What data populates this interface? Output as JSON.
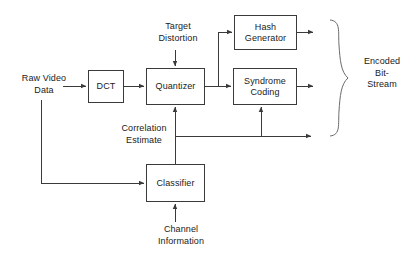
{
  "diagram": {
    "stroke_color": "#3a3a3a",
    "text_color": "#1a1a1a",
    "background": "#ffffff",
    "nodes": [
      {
        "id": "dct",
        "label": "DCT"
      },
      {
        "id": "quantizer",
        "label": "Quantizer"
      },
      {
        "id": "hash",
        "label": "Hash\nGenerator"
      },
      {
        "id": "syndrome",
        "label": "Syndrome\nCoding"
      },
      {
        "id": "classifier",
        "label": "Classifier"
      }
    ],
    "labels": [
      {
        "id": "raw-video",
        "text": "Raw Video\nData"
      },
      {
        "id": "target",
        "text": "Target\nDistortion"
      },
      {
        "id": "correlation",
        "text": "Correlation\nEstimate"
      },
      {
        "id": "channel",
        "text": "Channel\nInformation"
      },
      {
        "id": "encoded",
        "text": "Encoded\nBit-\nStream"
      }
    ],
    "connections": [
      {
        "from": "raw-video",
        "to": "dct"
      },
      {
        "from": "dct",
        "to": "quantizer"
      },
      {
        "from": "target",
        "to": "quantizer"
      },
      {
        "from": "quantizer",
        "to": "hash"
      },
      {
        "from": "quantizer",
        "to": "syndrome"
      },
      {
        "from": "hash",
        "to": "encoded"
      },
      {
        "from": "syndrome",
        "to": "encoded"
      },
      {
        "from": "correlation",
        "to": "encoded"
      },
      {
        "from": "classifier",
        "to": "quantizer"
      },
      {
        "from": "classifier",
        "to": "syndrome"
      },
      {
        "from": "raw-video",
        "to": "classifier"
      },
      {
        "from": "channel",
        "to": "classifier"
      }
    ]
  }
}
